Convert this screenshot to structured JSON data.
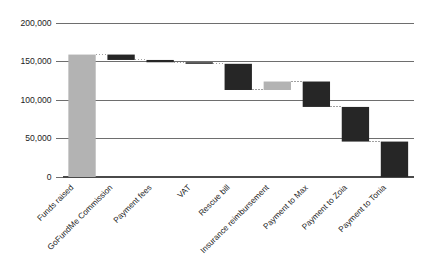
{
  "chart_data": {
    "type": "bar",
    "subtype": "waterfall",
    "title": "",
    "subtitle": "",
    "xlabel": "",
    "ylabel": "",
    "grid": true,
    "legend_position": "none",
    "ylim": [
      0,
      200000
    ],
    "ytick_labels": [
      "200,000",
      "150,000",
      "100,000",
      "50,000",
      "0"
    ],
    "ytick_values": [
      200000,
      150000,
      100000,
      50000,
      0
    ],
    "categories": [
      "Funds raised",
      "GoFundMe Commission",
      "Payment fees",
      "VAT",
      "Rescue bill",
      "Insurance reimbursement",
      "Payment to Max",
      "Payment to Zoia",
      "Payment to Tonia"
    ],
    "values": [
      159000,
      -7000,
      -3000,
      -2000,
      -34000,
      11000,
      -33000,
      -45000,
      -46000
    ],
    "cumulative_start": [
      0,
      159000,
      152000,
      149000,
      147000,
      113000,
      124000,
      91000,
      46000
    ],
    "cumulative_end": [
      159000,
      152000,
      149000,
      147000,
      113000,
      124000,
      91000,
      46000,
      0
    ],
    "bar_kinds": [
      "increase",
      "decrease",
      "decrease",
      "decrease",
      "decrease",
      "increase",
      "decrease",
      "decrease",
      "decrease"
    ],
    "colors": {
      "increase": "#b3b3b3",
      "decrease": "#262626",
      "gridline": "#6e6e6e",
      "axis": "#4a4a4a",
      "connector": "#8a8a8a",
      "text": "#1c1c1c",
      "background": "#ffffff"
    },
    "label_rotation_degrees": -45
  }
}
